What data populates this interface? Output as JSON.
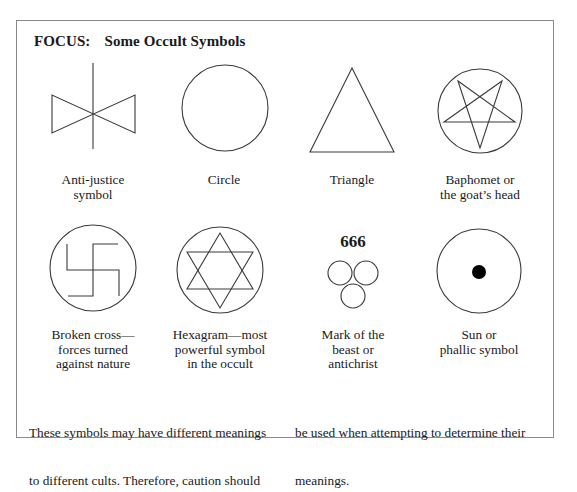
{
  "title": {
    "label": "FOCUS:",
    "text": "Some Occult Symbols"
  },
  "symbols": [
    {
      "id": "anti-justice",
      "icon": "anti-justice-icon",
      "lines": [
        "Anti-justice",
        "symbol"
      ]
    },
    {
      "id": "circle",
      "icon": "circle-icon",
      "lines": [
        "Circle"
      ]
    },
    {
      "id": "triangle",
      "icon": "triangle-icon",
      "lines": [
        "Triangle"
      ]
    },
    {
      "id": "baphomet",
      "icon": "pentagram-in-circle-icon",
      "lines": [
        "Baphomet or",
        "the goat’s head"
      ]
    },
    {
      "id": "broken-cross",
      "icon": "broken-cross-icon",
      "lines": [
        "Broken cross—",
        "forces turned",
        "against nature"
      ]
    },
    {
      "id": "hexagram",
      "icon": "hexagram-icon",
      "lines": [
        "Hexagram—most",
        "powerful symbol",
        "in the occult"
      ]
    },
    {
      "id": "mark-of-beast",
      "icon": "three-circles-icon",
      "number": "666",
      "lines": [
        "Mark of the",
        "beast or",
        "antichrist"
      ]
    },
    {
      "id": "sun",
      "icon": "circle-with-dot-icon",
      "lines": [
        "Sun or",
        "phallic symbol"
      ]
    }
  ],
  "footer": {
    "left_lines": [
      "These symbols may have different meanings",
      "to different cults. Therefore, caution should"
    ],
    "right_lines": [
      "be used when attempting to determine their",
      "meanings."
    ]
  }
}
